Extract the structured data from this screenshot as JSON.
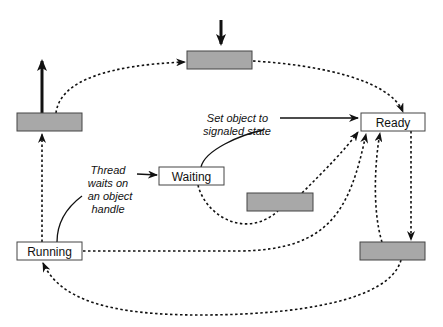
{
  "diagram": {
    "type": "state-transition",
    "states": {
      "ready": "Ready",
      "waiting": "Waiting",
      "running": "Running"
    },
    "unlabeled_states": 4,
    "annotations": {
      "set_signaled": [
        "Set object to",
        "signaled state"
      ],
      "thread_waits": [
        "Thread",
        "waits on",
        "an object",
        "handle"
      ]
    },
    "colors": {
      "gray_box": "#a8a8a8",
      "white_box": "#ffffff",
      "line": "#111111"
    }
  }
}
